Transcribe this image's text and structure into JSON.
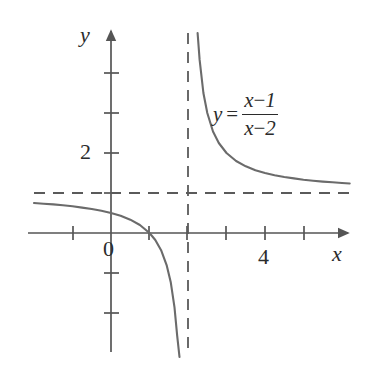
{
  "figure": {
    "type": "rational-function-graph",
    "title": "",
    "background": "#ffffff",
    "curve_color": "#6b6b6b",
    "axis_color": "#555555",
    "dash_color": "#5a5a5a",
    "text_color": "#2b2b2b"
  },
  "axes": {
    "x_axis_label": "x",
    "y_axis_label": "y",
    "origin_label": "0",
    "x_ticks": [
      -1,
      1,
      2,
      3,
      4,
      5
    ],
    "y_ticks": [
      -2,
      -1,
      1,
      2,
      3,
      4
    ],
    "x_tick_labels": [
      {
        "value": 4,
        "text": "4"
      }
    ],
    "y_tick_labels": [
      {
        "value": 2,
        "text": "2"
      }
    ],
    "xlim": [
      -2.6,
      6.2
    ],
    "ylim": [
      -3.0,
      5.1
    ],
    "grid": false
  },
  "equation": {
    "lhs": "y",
    "equals": "=",
    "numerator_var": "x",
    "numerator_op": "−",
    "numerator_const": "1",
    "denominator_var": "x",
    "denominator_op": "−",
    "denominator_const": "2",
    "plain": "y = (x - 1)/(x - 2)"
  },
  "asymptotes": {
    "vertical": {
      "x": 2,
      "style": "dashed"
    },
    "horizontal": {
      "y": 1,
      "style": "dashed"
    }
  },
  "chart_data": {
    "type": "line",
    "title": "",
    "xlabel": "x",
    "ylabel": "y",
    "xlim": [
      -2.6,
      6.2
    ],
    "ylim": [
      -3.0,
      5.1
    ],
    "grid": false,
    "legend": null,
    "annotations": [
      {
        "text": "y = (x - 1)/(x - 2)",
        "x": 3.0,
        "y": 3.0
      }
    ],
    "series": [
      {
        "name": "left-branch",
        "x": [
          -2.0,
          -1.75,
          -1.5,
          -1.25,
          -1.0,
          -0.75,
          -0.5,
          -0.25,
          0.0,
          0.25,
          0.5,
          0.75,
          1.0,
          1.15,
          1.3,
          1.45,
          1.55,
          1.65,
          1.72,
          1.78,
          1.82,
          1.855
        ],
        "y": [
          0.75,
          0.733,
          0.714,
          0.692,
          0.667,
          0.636,
          0.6,
          0.556,
          0.5,
          0.429,
          0.333,
          0.2,
          0.0,
          -0.176,
          -0.429,
          -0.818,
          -1.222,
          -1.857,
          -2.571,
          -3.545,
          -4.556,
          -5.897
        ]
      },
      {
        "name": "right-branch",
        "x": [
          2.25,
          2.3,
          2.4,
          2.5,
          2.65,
          2.8,
          3.0,
          3.25,
          3.5,
          3.75,
          4.0,
          4.25,
          4.5,
          4.75,
          5.0,
          5.25,
          5.5,
          5.75,
          6.0,
          6.2
        ],
        "y": [
          5.0,
          4.333,
          3.5,
          3.0,
          2.538,
          2.25,
          2.0,
          1.8,
          1.667,
          1.571,
          1.5,
          1.444,
          1.4,
          1.364,
          1.333,
          1.308,
          1.286,
          1.267,
          1.25,
          1.238
        ]
      }
    ],
    "asymptote_lines": [
      {
        "orientation": "vertical",
        "value": 2
      },
      {
        "orientation": "horizontal",
        "value": 1
      }
    ],
    "x_intercept": 1,
    "y_intercept": 0.5
  }
}
